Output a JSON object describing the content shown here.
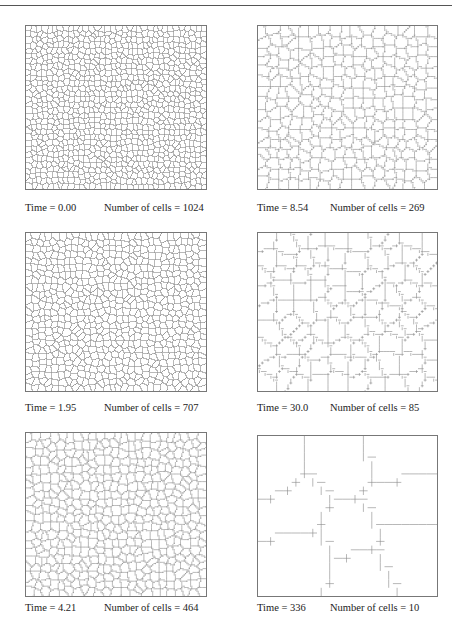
{
  "figure": {
    "panels": [
      {
        "time": "Time = 0.00",
        "cells": "Number of cells = 1024",
        "n": 1024
      },
      {
        "time": "Time = 8.54",
        "cells": "Number of cells = 269",
        "n": 269
      },
      {
        "time": "Time = 1.95",
        "cells": "Number of cells = 707",
        "n": 707
      },
      {
        "time": "Time = 30.0",
        "cells": "Number of cells = 85",
        "n": 85
      },
      {
        "time": "Time = 4.21",
        "cells": "Number of cells = 464",
        "n": 464
      },
      {
        "time": "Time = 336",
        "cells": "Number of cells = 10",
        "n": 10
      }
    ]
  }
}
